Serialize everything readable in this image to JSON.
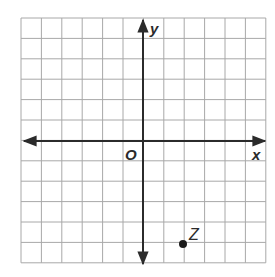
{
  "diagram": {
    "type": "coordinate-grid",
    "grid": {
      "columns": 12,
      "rows": 12,
      "line_color": "#a8a8a8"
    },
    "axes": {
      "x_label": "x",
      "y_label": "y",
      "origin_label": "O",
      "color": "#2b2b2b"
    },
    "points": [
      {
        "label": "Z",
        "x": 2,
        "y": -5,
        "color": "#1a1a1a"
      }
    ]
  }
}
